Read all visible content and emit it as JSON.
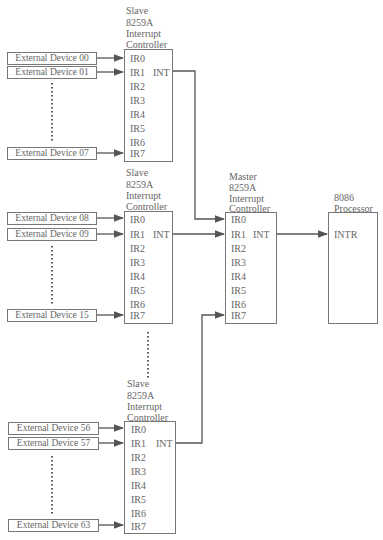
{
  "slaves": [
    {
      "title_lines": [
        "Slave",
        "8259A",
        "Interrupt",
        "Controller"
      ],
      "pins": [
        "IR0",
        "IR1",
        "IR2",
        "IR3",
        "IR4",
        "IR5",
        "IR6",
        "IR7"
      ],
      "output_pin": "INT",
      "devices": [
        "External Device 00",
        "External Device 01",
        "External Device 07"
      ]
    },
    {
      "title_lines": [
        "Slave",
        "8259A",
        "Interrupt",
        "Controller"
      ],
      "pins": [
        "IR0",
        "IR1",
        "IR2",
        "IR3",
        "IR4",
        "IR5",
        "IR6",
        "IR7"
      ],
      "output_pin": "INT",
      "devices": [
        "External Device 08",
        "External Device 09",
        "External Device 15"
      ]
    },
    {
      "title_lines": [
        "Slave",
        "8259A",
        "Interrupt",
        "Controller"
      ],
      "pins": [
        "IR0",
        "IR1",
        "IR2",
        "IR3",
        "IR4",
        "IR5",
        "IR6",
        "IR7"
      ],
      "output_pin": "INT",
      "devices": [
        "External Device 56",
        "External Device 57",
        "External Device 63"
      ]
    }
  ],
  "master": {
    "title_lines": [
      "Master",
      "8259A",
      "Interrupt",
      "Controller"
    ],
    "pins": [
      "IR0",
      "IR1",
      "IR2",
      "IR3",
      "IR4",
      "IR5",
      "IR6",
      "IR7"
    ],
    "output_pin": "INT"
  },
  "processor": {
    "title_lines": [
      "8086",
      "Processor"
    ],
    "input_pin": "INTR"
  },
  "colors": {
    "line": "#555555",
    "text": "#666666"
  }
}
